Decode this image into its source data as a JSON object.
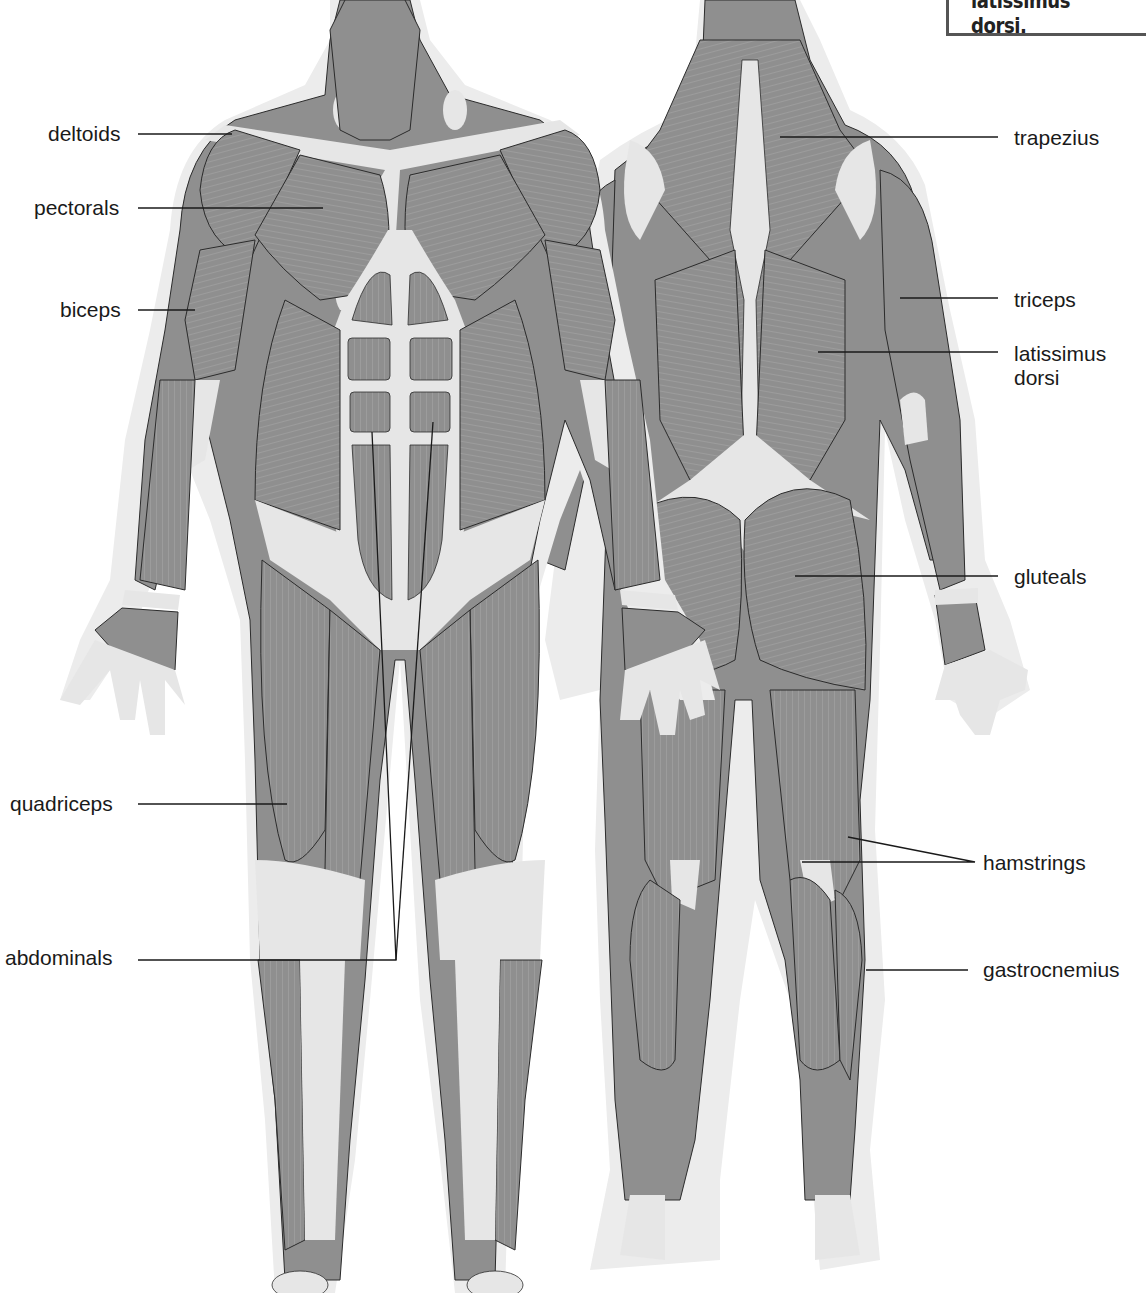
{
  "diagram": {
    "views": [
      "front",
      "back"
    ],
    "colors": {
      "muscle": "#8f8f8f",
      "muscle_dark": "#7e7e7e",
      "tendon": "#e6e6e6",
      "skin_halo": "#ececec",
      "outline": "#2b2b2b",
      "label_text": "#1a1a1a",
      "background": "#ffffff"
    }
  },
  "callout_box": {
    "text": "latissimus dorsi."
  },
  "labels": {
    "left": [
      {
        "id": "deltoids",
        "text": "deltoids"
      },
      {
        "id": "pectorals",
        "text": "pectorals"
      },
      {
        "id": "biceps",
        "text": "biceps"
      },
      {
        "id": "quadriceps",
        "text": "quadriceps"
      },
      {
        "id": "abdominals",
        "text": "abdominals"
      }
    ],
    "right": [
      {
        "id": "trapezius",
        "text": "trapezius"
      },
      {
        "id": "triceps",
        "text": "triceps"
      },
      {
        "id": "latissimus_dorsi",
        "text": "latissimus\ndorsi"
      },
      {
        "id": "gluteals",
        "text": "gluteals"
      },
      {
        "id": "hamstrings",
        "text": "hamstrings"
      },
      {
        "id": "gastrocnemius",
        "text": "gastrocnemius"
      }
    ]
  }
}
